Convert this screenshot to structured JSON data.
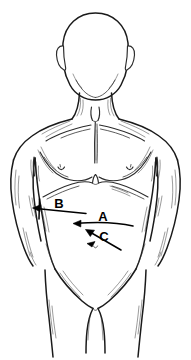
{
  "figure": {
    "view": "anterior",
    "style": "black-and-white-line-drawing",
    "background_color": "#ffffff",
    "line_color": "#1a1a1a",
    "width_px": 191,
    "height_px": 360
  },
  "labels": [
    {
      "id": "A",
      "text": "A",
      "x": 103,
      "y": 219,
      "arrow_direction": "left",
      "arrow_from_x": 130,
      "arrow_from_y": 224,
      "arrow_to_x": 74,
      "arrow_to_y": 223,
      "region": "mid-abdomen"
    },
    {
      "id": "B",
      "text": "B",
      "x": 59,
      "y": 205,
      "arrow_direction": "left",
      "arrow_from_x": 86,
      "arrow_from_y": 213,
      "arrow_to_x": 33,
      "arrow_to_y": 208,
      "region": "left-upper-quadrant-costal-margin"
    },
    {
      "id": "C",
      "text": "C",
      "x": 104,
      "y": 238,
      "arrow_direction": "up-left",
      "arrow_from_x": 119,
      "arrow_from_y": 249,
      "arrow_to_x": 86,
      "arrow_to_y": 230,
      "region": "lower-abdomen-suprapubic"
    }
  ],
  "anatomy_features": [
    {
      "name": "head",
      "label": "Head"
    },
    {
      "name": "ear-left",
      "label": "Left ear"
    },
    {
      "name": "ear-right",
      "label": "Right ear"
    },
    {
      "name": "neck",
      "label": "Neck"
    },
    {
      "name": "suprasternal-notch",
      "label": "Suprasternal notch"
    },
    {
      "name": "clavicle-left",
      "label": "Left clavicle"
    },
    {
      "name": "clavicle-right",
      "label": "Right clavicle"
    },
    {
      "name": "sternum",
      "label": "Sternum"
    },
    {
      "name": "pectoral-left",
      "label": "Left pectoral"
    },
    {
      "name": "pectoral-right",
      "label": "Right pectoral"
    },
    {
      "name": "nipple-left",
      "label": "Left nipple"
    },
    {
      "name": "nipple-right",
      "label": "Right nipple"
    },
    {
      "name": "costal-margin",
      "label": "Costal margin"
    },
    {
      "name": "xiphoid-process",
      "label": "Xiphoid process"
    },
    {
      "name": "abdomen",
      "label": "Abdomen"
    },
    {
      "name": "umbilicus",
      "label": "Umbilicus"
    },
    {
      "name": "arm-left",
      "label": "Left arm"
    },
    {
      "name": "arm-right",
      "label": "Right arm"
    },
    {
      "name": "inguinal-fold-left",
      "label": "Left inguinal fold"
    },
    {
      "name": "inguinal-fold-right",
      "label": "Right inguinal fold"
    },
    {
      "name": "groin",
      "label": "Groin"
    },
    {
      "name": "thigh-left",
      "label": "Left thigh"
    },
    {
      "name": "thigh-right",
      "label": "Right thigh"
    }
  ]
}
